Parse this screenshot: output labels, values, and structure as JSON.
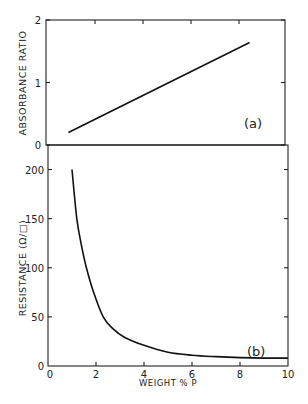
{
  "chart_data": [
    {
      "type": "line",
      "panel_label": "(a)",
      "xlabel": "",
      "ylabel": "ABSORBANCE RATIO",
      "xlim": [
        0,
        10
      ],
      "ylim": [
        0,
        2
      ],
      "yticks": [
        "0",
        "1",
        "2"
      ],
      "xticks": [
        0,
        2,
        4,
        6,
        8,
        10
      ],
      "grid": false,
      "series": [
        {
          "name": "absorbance",
          "x": [
            0.85,
            8.4
          ],
          "y": [
            0.2,
            1.64
          ]
        }
      ]
    },
    {
      "type": "line",
      "panel_label": "(b)",
      "xlabel": "WEIGHT % P",
      "ylabel": "RESISTANCE (Ω/□)",
      "xlim": [
        0,
        10
      ],
      "ylim": [
        0,
        200
      ],
      "xticks": [
        "0",
        "2",
        "4",
        "6",
        "8",
        "10"
      ],
      "yticks": [
        "0",
        "50",
        "100",
        "150",
        "200"
      ],
      "grid": false,
      "series": [
        {
          "name": "resistance",
          "x": [
            1.0,
            1.2,
            1.4,
            1.6,
            1.9,
            2.3,
            2.7,
            3.2,
            4.0,
            5.0,
            6.0,
            7.0,
            8.0,
            9.0,
            10.0
          ],
          "y": [
            200,
            150,
            122,
            100,
            75,
            50,
            38,
            29,
            21,
            14,
            11,
            9.5,
            8.5,
            8,
            8
          ]
        }
      ]
    }
  ]
}
